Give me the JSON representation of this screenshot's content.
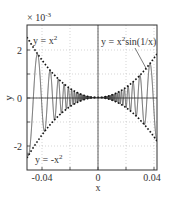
{
  "chart_data": {
    "type": "line",
    "title": "",
    "xlabel": "x",
    "ylabel": "y",
    "y_multiplier_label": "× 10^-3",
    "xlim": [
      -0.05,
      0.0425
    ],
    "ylim": [
      -3.0,
      3.0
    ],
    "ylim_scale": 0.001,
    "x_ticks": [
      -0.04,
      -0.02,
      0,
      0.02,
      0.04
    ],
    "x_tick_labels": [
      "-0.04",
      "",
      "0",
      "",
      "0.04"
    ],
    "y_ticks": [
      -2,
      -1,
      0,
      1,
      2
    ],
    "y_tick_labels": [
      "-2",
      "",
      "0",
      "",
      "2"
    ],
    "grid": true,
    "series": [
      {
        "name": "y = x²",
        "style": "dotted",
        "function": "x^2"
      },
      {
        "name": "y = -x²",
        "style": "dotted",
        "function": "-x^2"
      },
      {
        "name": "y = x² sin(1/x)",
        "style": "solid",
        "function": "x^2*sin(1/x)"
      }
    ],
    "annotations": [
      {
        "text": "y = x²",
        "position": "upper-left"
      },
      {
        "text": "y = -x²",
        "position": "lower-left"
      },
      {
        "text": "y = x² sin(1/x)",
        "position": "upper-right",
        "arrow": true
      }
    ]
  },
  "labels": {
    "multiplier_base": "× 10",
    "multiplier_exp": "-3",
    "xlabel": "x",
    "ylabel": "y",
    "ann_upper_base": "y = x",
    "ann_upper_exp": "2",
    "ann_lower_base": "y = -x",
    "ann_lower_exp": "2",
    "ann_right_a": "y = x",
    "ann_right_exp": "2",
    "ann_right_b": "sin(1/x)",
    "xt_neg": "-0.04",
    "xt_zero": "0",
    "xt_pos": "0.04",
    "yt_pos": "2",
    "yt_zero": "0",
    "yt_neg": "-2"
  }
}
